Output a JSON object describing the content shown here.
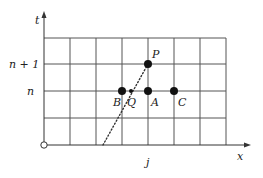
{
  "diagram": {
    "axes": {
      "x_label": "x",
      "t_label": "t",
      "x_tick_label": "j",
      "t_tick_labels": {
        "n": "n",
        "n_plus_1": "n + 1"
      }
    },
    "grid": {
      "x_lines": [
        44,
        70,
        96,
        122,
        148,
        174,
        200,
        226
      ],
      "y_lines": [
        38,
        64,
        91,
        118,
        145
      ]
    },
    "points": [
      {
        "id": "P",
        "label": "P",
        "x": 148,
        "y": 64,
        "filled": true
      },
      {
        "id": "B",
        "label": "B",
        "x": 122,
        "y": 91,
        "filled": true
      },
      {
        "id": "A",
        "label": "A",
        "x": 148,
        "y": 91,
        "filled": true
      },
      {
        "id": "C",
        "label": "C",
        "x": 174,
        "y": 91,
        "filled": true
      },
      {
        "id": "Q",
        "label": "Q",
        "x": 131,
        "y": 91,
        "filled": true,
        "small": true
      }
    ],
    "characteristic_line": {
      "from": [
        103,
        145
      ],
      "to": [
        148,
        64
      ],
      "style": "dotted"
    },
    "origin_marker": "circle"
  }
}
